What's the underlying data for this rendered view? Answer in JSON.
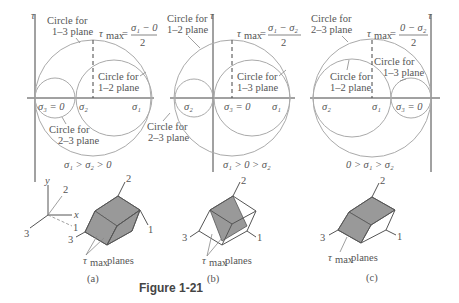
{
  "figure": {
    "caption": "Figure 1-21",
    "axis_tau": "τ",
    "panels": [
      {
        "id": "a",
        "label": "(a)",
        "condition": "σ₁ > σ₂ > 0",
        "tau_max_lhs": "τ",
        "tau_max_sub": "max",
        "tau_max_num": "σ₁ − 0",
        "tau_max_den": "2",
        "circle_labels": {
          "big": [
            "Circle for",
            "1–3 plane"
          ],
          "right": [
            "Circle for",
            "1–2 plane"
          ],
          "small": [
            "Circle for",
            "2–3 plane"
          ]
        },
        "axis_labels": {
          "s3": "σ₃ = 0",
          "s2": "σ₂",
          "s1": "σ₁"
        },
        "block_labels": {
          "axis2": "2",
          "axis1": "1",
          "axis3": "3",
          "planes": "planes"
        },
        "coord_labels": {
          "y": "y",
          "x": "x",
          "z2": "2",
          "z1": "1",
          "z3": "3"
        }
      },
      {
        "id": "b",
        "label": "(b)",
        "condition": "σ₁ > 0 > σ₂",
        "tau_max_lhs": "τ",
        "tau_max_sub": "max",
        "tau_max_num": "σ₁ − σ₂",
        "tau_max_den": "2",
        "circle_labels": {
          "big": [
            "Circle for",
            "1–2 plane"
          ],
          "right": [
            "Circle for",
            "1–3 plane"
          ],
          "small": [
            "Circle for",
            "2–3 plane"
          ],
          "outer": [
            "Circle for",
            "2–3 plane"
          ]
        },
        "axis_labels": {
          "s2": "σ₂",
          "s3": "σ₃ = 0",
          "s1": "σ₁"
        },
        "block_labels": {
          "axis2": "2",
          "axis1": "1",
          "axis3": "3",
          "planes": "planes"
        }
      },
      {
        "id": "c",
        "label": "(c)",
        "condition": "0 > σ₁ > σ₂",
        "tau_max_lhs": "τ",
        "tau_max_sub": "max",
        "tau_max_num": "0 − σ₂",
        "tau_max_den": "2",
        "circle_labels": {
          "big": [
            "Circle for",
            "2–3 plane"
          ],
          "left": [
            "Circle for",
            "1–2 plane"
          ],
          "small": [
            "Circle for",
            "1–3 plane"
          ]
        },
        "axis_labels": {
          "s2": "σ₂",
          "s1": "σ₁",
          "s3": "σ₃ = 0"
        },
        "block_labels": {
          "axis2": "2",
          "axis1": "1",
          "axis3": "3",
          "planes": "planes"
        }
      }
    ]
  }
}
